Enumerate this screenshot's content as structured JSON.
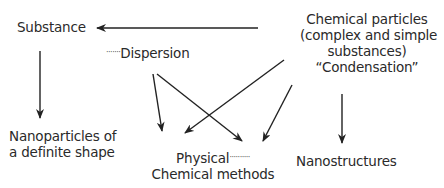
{
  "nodes": {
    "substance": "Substance",
    "dispersion": "Dispersion",
    "dispersion_leader": "·······",
    "chemical_particles": {
      "line1": "Chemical particles",
      "line2": "(complex and simple",
      "line3": "substances)",
      "line4": "“Condensation”"
    },
    "nanoparticles": {
      "line1": "Nanoparticles of",
      "line2": "a definite shape"
    },
    "methods": {
      "line1": "Physical",
      "line1_leader": "··········",
      "line2": "Chemical methods"
    },
    "nanostructures": "Nanostructures"
  },
  "edges": [
    {
      "from": "chemical_particles",
      "to": "substance"
    },
    {
      "from": "substance",
      "to": "nanoparticles"
    },
    {
      "from": "dispersion",
      "to": "methods-physical"
    },
    {
      "from": "dispersion",
      "to": "methods-chemical"
    },
    {
      "from": "chemical_particles",
      "to": "methods-physical"
    },
    {
      "from": "chemical_particles",
      "to": "methods-chemical"
    },
    {
      "from": "chemical_particles",
      "to": "nanostructures"
    }
  ],
  "colors": {
    "text": "#2a2a2a",
    "arrow": "#222222",
    "background": "#ffffff"
  }
}
